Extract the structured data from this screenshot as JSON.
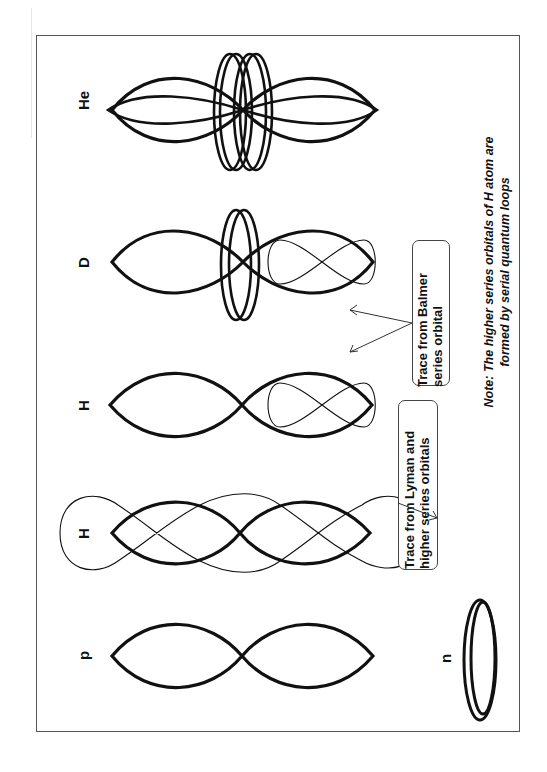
{
  "figure": {
    "orientation": "rotated-90-ccw",
    "particles": [
      {
        "id": "he",
        "label": "He"
      },
      {
        "id": "d",
        "label": "D"
      },
      {
        "id": "h_balmer",
        "label": "H"
      },
      {
        "id": "h_lyman",
        "label": "H"
      },
      {
        "id": "p",
        "label": "p"
      },
      {
        "id": "n",
        "label": "n"
      }
    ],
    "callouts": {
      "balmer": {
        "line1": "Trace from Balmer",
        "line2": "series orbital"
      },
      "lyman": {
        "line1": "Trace from Lyman and",
        "line2": "higher series orbitals"
      }
    },
    "note": {
      "line1": "Note: The higher series orbitals of H atom are",
      "line2": "formed by serial quantum loops"
    },
    "colors": {
      "stroke": "#111111",
      "frame": "#555555",
      "background": "#ffffff"
    }
  }
}
